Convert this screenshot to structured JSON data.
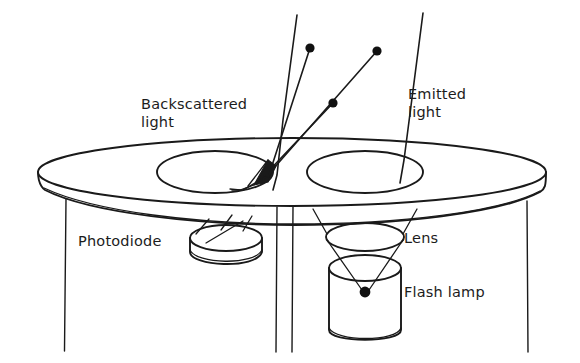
{
  "figure": {
    "kind": "line-art-diagram",
    "background_color": "#ffffff",
    "ink_color": "#1a1a1a",
    "width": 580,
    "height": 363
  },
  "labels": {
    "backscattered_line1": "Backscattered",
    "backscattered_line2": "light",
    "emitted_line1": "Emitted",
    "emitted_line2": "light",
    "photodiode": "Photodiode",
    "lens": "Lens",
    "flash_lamp": "Flash lamp"
  },
  "components": [
    {
      "id": "table",
      "name": "table slab",
      "shape": "elliptical-disc"
    },
    {
      "id": "left-aperture",
      "name": "left hole",
      "shape": "ellipse"
    },
    {
      "id": "right-aperture",
      "name": "right hole",
      "shape": "ellipse"
    },
    {
      "id": "mirror",
      "name": "angled mirror",
      "shape": "filled-wedge"
    },
    {
      "id": "photodiode",
      "name": "photodiode",
      "shape": "short-cylinder"
    },
    {
      "id": "lens",
      "name": "lens",
      "shape": "ellipse"
    },
    {
      "id": "flash-lamp",
      "name": "flash lamp",
      "shape": "cylinder"
    }
  ],
  "ray_dots": [
    {
      "id": "dot-a",
      "cx": 310,
      "cy": 48
    },
    {
      "id": "dot-b",
      "cx": 377,
      "cy": 51
    },
    {
      "id": "dot-c",
      "cx": 333,
      "cy": 103
    },
    {
      "id": "dot-source",
      "cx": 365,
      "cy": 292
    }
  ]
}
